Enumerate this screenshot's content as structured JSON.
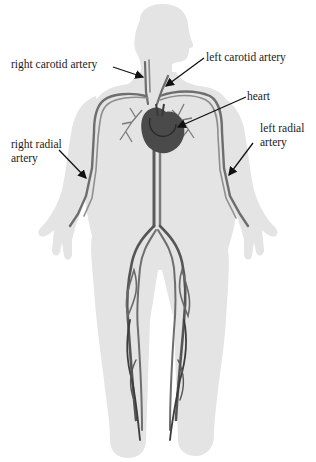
{
  "diagram": {
    "colors": {
      "background": "#ffffff",
      "body": "#e4e4e4",
      "vessel": "#6e6e6e",
      "vessel_dark": "#3c3c3c",
      "heart": "#4a4a4a",
      "arrow": "#111111",
      "label_text": "#1a1a1a"
    },
    "labels": {
      "right_carotid": "right carotid artery",
      "left_carotid": "left carotid artery",
      "heart": "heart",
      "right_radial_line1": "right radial",
      "right_radial_line2": "artery",
      "left_radial_line1": "left radial",
      "left_radial_line2": "artery"
    }
  }
}
